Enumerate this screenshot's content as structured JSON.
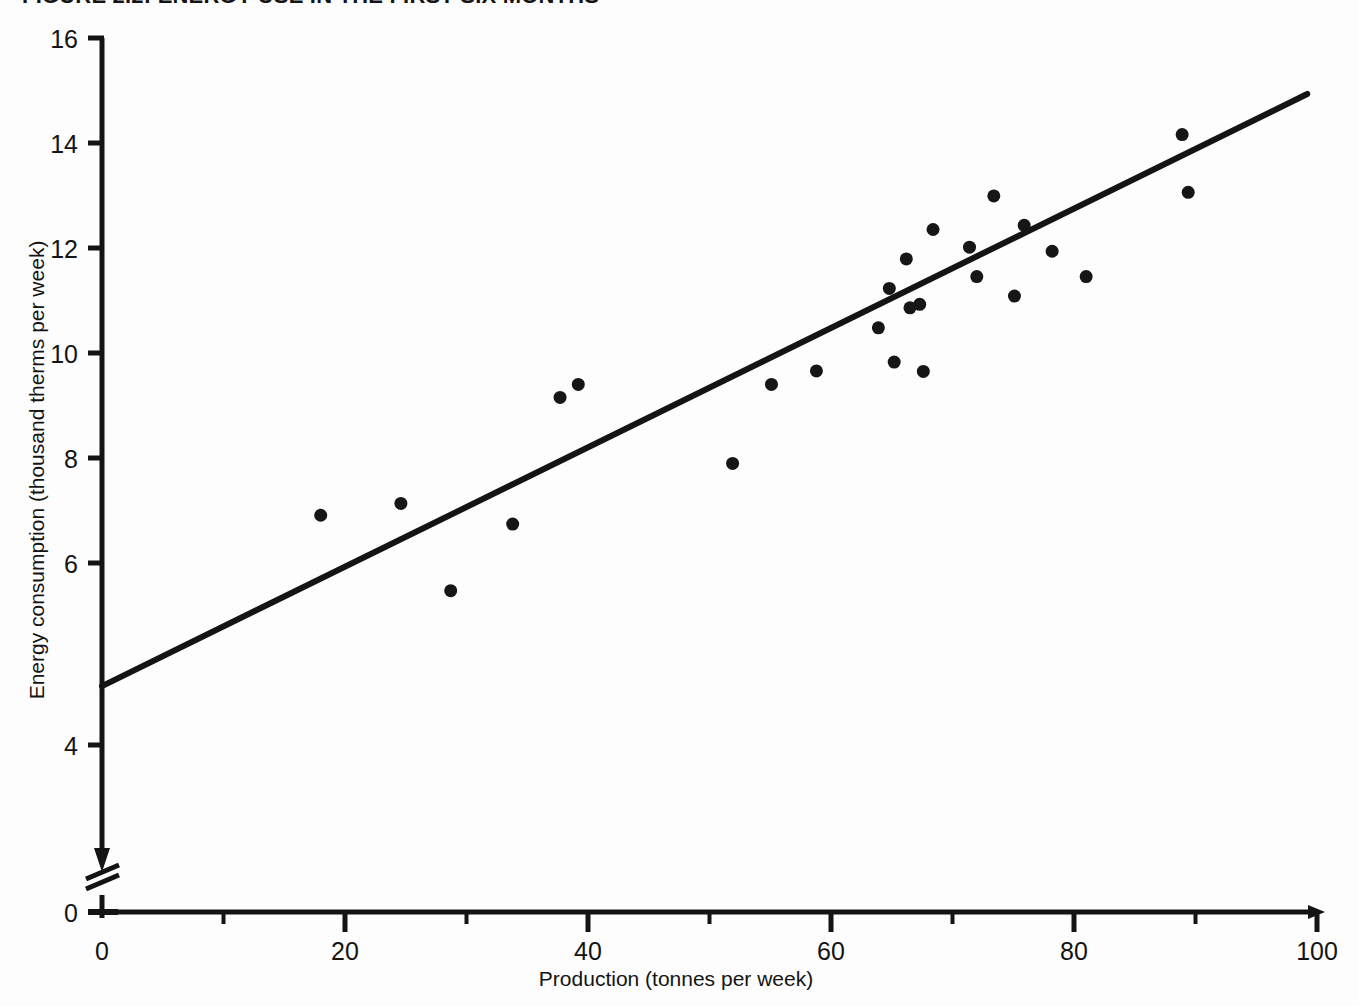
{
  "figure": {
    "title": "FIGURE 2.2: ENERGY USE IN THE FIRST SIX MONTHS",
    "background_color": "#fdfdfd",
    "ink_color": "#141414"
  },
  "chart_data": {
    "type": "scatter",
    "title": "FIGURE 2.2: ENERGY USE IN THE FIRST SIX MONTHS",
    "xlabel": "Production (tonnes per week)",
    "ylabel": "Energy consumption (thousand therms per week)",
    "xlim": [
      0,
      100
    ],
    "ylim": [
      0,
      16
    ],
    "y_axis_break": true,
    "y_break_between": [
      0,
      4
    ],
    "grid": false,
    "legend": null,
    "x_ticks_major": [
      0,
      20,
      40,
      60,
      80,
      100
    ],
    "x_ticks_minor": [
      10,
      30,
      50,
      70,
      90
    ],
    "x_tick_labels": [
      "0",
      "20",
      "40",
      "60",
      "80",
      "100"
    ],
    "y_ticks_major": [
      0,
      4,
      6,
      8,
      10,
      12,
      14,
      16
    ],
    "y_tick_labels": [
      "0",
      "4",
      "6",
      "8",
      "10",
      "12",
      "14",
      "16"
    ],
    "origin_label_x": "0",
    "origin_label_y": "0",
    "marker": {
      "shape": "circle",
      "color": "#161616",
      "size_px": 13
    },
    "points": [
      {
        "x": 18.0,
        "y": 7.9
      },
      {
        "x": 24.6,
        "y": 8.1
      },
      {
        "x": 28.7,
        "y": 6.62
      },
      {
        "x": 33.8,
        "y": 7.75
      },
      {
        "x": 37.7,
        "y": 9.9
      },
      {
        "x": 39.2,
        "y": 10.12
      },
      {
        "x": 51.9,
        "y": 8.78
      },
      {
        "x": 55.1,
        "y": 10.12
      },
      {
        "x": 58.8,
        "y": 10.35
      },
      {
        "x": 63.9,
        "y": 11.08
      },
      {
        "x": 64.8,
        "y": 11.75
      },
      {
        "x": 65.2,
        "y": 10.5
      },
      {
        "x": 66.2,
        "y": 12.25
      },
      {
        "x": 66.5,
        "y": 11.42
      },
      {
        "x": 67.3,
        "y": 11.48
      },
      {
        "x": 67.6,
        "y": 10.34
      },
      {
        "x": 68.4,
        "y": 12.75
      },
      {
        "x": 71.4,
        "y": 12.45
      },
      {
        "x": 72.0,
        "y": 11.95
      },
      {
        "x": 73.4,
        "y": 13.32
      },
      {
        "x": 75.1,
        "y": 11.62
      },
      {
        "x": 75.9,
        "y": 12.82
      },
      {
        "x": 78.2,
        "y": 12.38
      },
      {
        "x": 81.0,
        "y": 11.95
      },
      {
        "x": 88.9,
        "y": 14.36
      },
      {
        "x": 89.4,
        "y": 13.38
      }
    ],
    "fit_line": {
      "type": "linear",
      "x_start": 0.0,
      "y_start": 5.0,
      "x_end": 99.2,
      "y_end": 15.05,
      "slope": 0.1013,
      "intercept": 5.0
    }
  },
  "axes": {
    "x_title": "Production (tonnes per week)",
    "y_title": "Energy consumption (thousand therms per week)"
  }
}
